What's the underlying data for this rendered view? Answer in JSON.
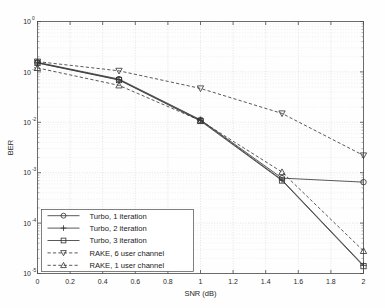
{
  "chart_data": {
    "type": "line",
    "title": "",
    "xlabel": "SNR (dB)",
    "ylabel": "BER",
    "xlim": [
      0,
      2
    ],
    "ylim": [
      1e-05,
      1
    ],
    "yscale": "log",
    "grid": true,
    "legend_position": "lower-left",
    "x": [
      0,
      0.5,
      1.0,
      1.5,
      2.0
    ],
    "xticks": [
      "0",
      "0.2",
      "0.4",
      "0.6",
      "0.8",
      "1",
      "1.2",
      "1.4",
      "1.6",
      "1.8",
      "2"
    ],
    "xtick_values": [
      0,
      0.2,
      0.4,
      0.6,
      0.8,
      1.0,
      1.2,
      1.4,
      1.6,
      1.8,
      2.0
    ],
    "yticks": [
      "10^0",
      "10^-1",
      "10^-2",
      "10^-3",
      "10^-4",
      "10^-5"
    ],
    "ytick_values": [
      1,
      0.1,
      0.01,
      0.001,
      0.0001,
      1e-05
    ],
    "ytick_mantissa": "10",
    "ytick_exponents": [
      "0",
      "-1",
      "-2",
      "-3",
      "-4",
      "-5"
    ],
    "series": [
      {
        "name": "Turbo, 1 iteration",
        "marker": "circle",
        "linestyle": "solid",
        "values": [
          0.155,
          0.072,
          0.0112,
          0.00078,
          0.00065
        ]
      },
      {
        "name": "Turbo, 2 iteration",
        "marker": "plus",
        "linestyle": "solid",
        "values": [
          0.152,
          0.07,
          0.011,
          0.00072,
          1.45e-05
        ]
      },
      {
        "name": "Turbo, 3 iteration",
        "marker": "square",
        "linestyle": "solid",
        "values": [
          0.15,
          0.069,
          0.0106,
          0.0007,
          1.4e-05
        ]
      },
      {
        "name": "RAKE, 6 user channel",
        "marker": "triangle-down",
        "linestyle": "dashed",
        "values": [
          0.16,
          0.105,
          0.047,
          0.015,
          0.0022
        ]
      },
      {
        "name": "RAKE, 1 user channel",
        "marker": "triangle-up",
        "linestyle": "dashed",
        "values": [
          0.12,
          0.054,
          0.0108,
          0.00103,
          2.8e-05
        ]
      }
    ]
  }
}
